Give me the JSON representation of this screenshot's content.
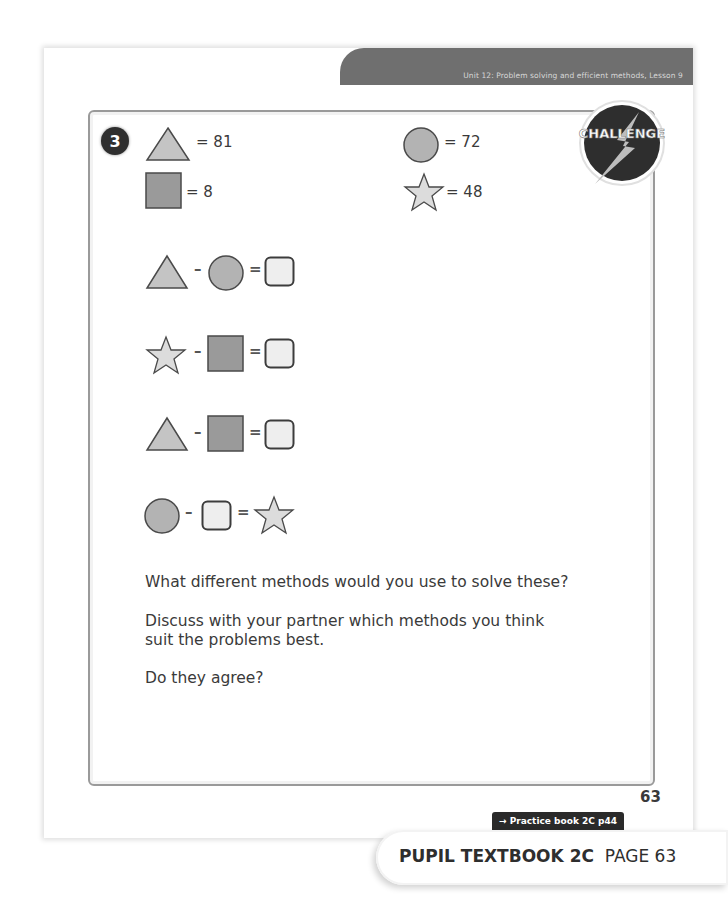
{
  "header": {
    "unit_title": "Unit 12: Problem solving and efficient methods, Lesson 9"
  },
  "question": {
    "number": "3",
    "badge_label": "CHALLENGE",
    "key": [
      {
        "shape": "triangle",
        "label": "= 81"
      },
      {
        "shape": "circle",
        "label": "= 72"
      },
      {
        "shape": "square",
        "label": "= 8"
      },
      {
        "shape": "star",
        "label": "= 48"
      }
    ],
    "equations": [
      {
        "terms": [
          "triangle",
          "circle",
          "answer-box"
        ],
        "ops": [
          "–",
          "="
        ]
      },
      {
        "terms": [
          "star",
          "square",
          "answer-box"
        ],
        "ops": [
          "–",
          "="
        ]
      },
      {
        "terms": [
          "triangle",
          "square",
          "answer-box"
        ],
        "ops": [
          "–",
          "="
        ]
      },
      {
        "terms": [
          "circle",
          "answer-box",
          "star"
        ],
        "ops": [
          "–",
          "="
        ]
      }
    ],
    "prompts": [
      "What different methods would you use to solve these?",
      "Discuss with your partner which methods you think",
      "suit the problems best.",
      "Do they agree?"
    ]
  },
  "footer": {
    "page_number": "63",
    "practice_link": "→ Practice book 2C p44",
    "book_title": "PUPIL TEXTBOOK 2C",
    "book_page": "PAGE 63"
  },
  "colors": {
    "triangle_fill": "#c4c4c4",
    "circle_fill": "#b3b3b3",
    "square_fill": "#9a9a9a",
    "star_fill": "#dcdcdc",
    "answer_box_fill": "#eeeeee",
    "outline": "#4a4a4a",
    "band": "#6f6f6f"
  }
}
